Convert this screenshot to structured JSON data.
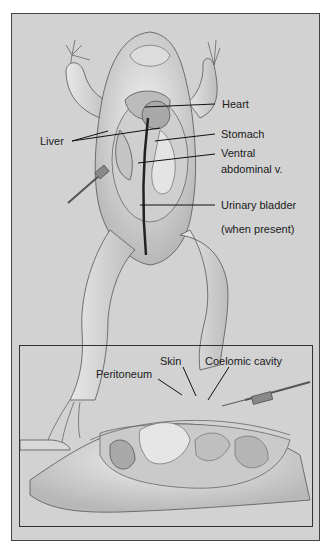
{
  "figure": {
    "top_panel": {
      "subject": "frog-ventral-dissection",
      "labels": {
        "heart": "Heart",
        "liver": "Liver",
        "stomach": "Stomach",
        "ventral_1": "Ventral",
        "ventral_2": "abdominal v.",
        "urinary": "Urinary bladder",
        "when_present": "(when present)"
      }
    },
    "bottom_panel": {
      "subject": "frog-lateral-coelomic-cavity",
      "labels": {
        "skin": "Skin",
        "coelomic": "Coelomic cavity",
        "peritoneum": "Peritoneum"
      }
    },
    "colors": {
      "background": "#d2d2d2",
      "frame": "#444444",
      "leader_line": "#111111",
      "text": "#1a1a1a"
    }
  }
}
